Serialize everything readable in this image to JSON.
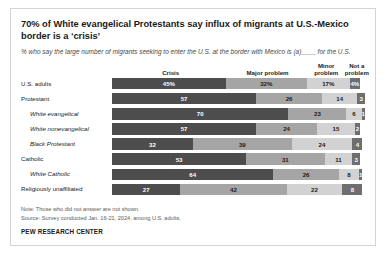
{
  "chart_data": {
    "type": "bar",
    "subtype": "stacked-horizontal-100",
    "title": "70% of White evangelical Protestants say influx of migrants at U.S.-Mexico border is a ‘crisis’",
    "subtitle": "% who say the large number of migrants seeking to enter the U.S. at the border with Mexico is (a)____ for the U.S.",
    "xlabel": "",
    "ylabel": "",
    "xlim": [
      0,
      100
    ],
    "grid": false,
    "legend_position": "top",
    "legend": [
      "Crisis",
      "Major problem",
      "Minor problem",
      "Not a problem"
    ],
    "series": [
      {
        "name": "Crisis",
        "values": [
          45,
          57,
          70,
          57,
          32,
          53,
          64,
          27
        ]
      },
      {
        "name": "Major problem",
        "values": [
          32,
          26,
          23,
          24,
          39,
          31,
          26,
          42
        ]
      },
      {
        "name": "Minor problem",
        "values": [
          17,
          14,
          6,
          15,
          24,
          11,
          8,
          22
        ]
      },
      {
        "name": "Not a problem",
        "values": [
          4,
          3,
          1,
          2,
          4,
          3,
          1,
          8
        ]
      }
    ],
    "categories": [
      "U.S. adults",
      "Protestant",
      "White evangelical",
      "White nonevangelical",
      "Black Protestant",
      "Catholic",
      "White Catholic",
      "Religiously unaffiliated"
    ],
    "rows": [
      {
        "label": "U.S. adults",
        "indent": false,
        "values": [
          "45%",
          "32%",
          "17%",
          "4%"
        ],
        "nums": [
          45,
          32,
          17,
          4
        ]
      },
      {
        "label": "Protestant",
        "indent": false,
        "values": [
          "57",
          "26",
          "14",
          "3"
        ],
        "nums": [
          57,
          26,
          14,
          3
        ]
      },
      {
        "label": "White evangelical",
        "indent": true,
        "values": [
          "70",
          "23",
          "6",
          "1"
        ],
        "nums": [
          70,
          23,
          6,
          1
        ]
      },
      {
        "label": "White nonevangelical",
        "indent": true,
        "values": [
          "57",
          "24",
          "15",
          "2"
        ],
        "nums": [
          57,
          24,
          15,
          2
        ]
      },
      {
        "label": "Black Protestant",
        "indent": true,
        "values": [
          "32",
          "39",
          "24",
          "4"
        ],
        "nums": [
          32,
          39,
          24,
          4
        ]
      },
      {
        "label": "Catholic",
        "indent": false,
        "values": [
          "53",
          "31",
          "11",
          "3"
        ],
        "nums": [
          53,
          31,
          11,
          3
        ]
      },
      {
        "label": "White Catholic",
        "indent": true,
        "values": [
          "64",
          "26",
          "8",
          "1"
        ],
        "nums": [
          64,
          26,
          8,
          1
        ]
      },
      {
        "label": "Religiously unaffiliated",
        "indent": false,
        "values": [
          "27",
          "42",
          "22",
          "8"
        ],
        "nums": [
          27,
          42,
          22,
          8
        ]
      }
    ],
    "colors": {
      "crisis": "#4d4d4d",
      "major_problem": "#a5a5a5",
      "minor_problem": "#d2d2d2",
      "not_a_problem": "#6e6e6e"
    }
  },
  "headers": [
    {
      "label": "Crisis",
      "center_pct": 23
    },
    {
      "label": "Major problem",
      "center_pct": 61
    },
    {
      "label": "Minor problem",
      "center_pct": 84
    },
    {
      "label": "Not a problem",
      "center_pct": 96
    }
  ],
  "footer": {
    "note": "Note: Those who did not answer are not shown.",
    "source": "Source: Survey conducted Jan. 16-21, 2024, among U.S. adults.",
    "brand": "PEW RESEARCH CENTER"
  }
}
